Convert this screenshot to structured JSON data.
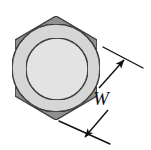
{
  "figure": {
    "background_color": "#ffffff",
    "width": 151,
    "height": 150
  },
  "shapes": {
    "hexagon": {
      "name": "hex-nut-body",
      "description": "Regular hexagon with vertices at top and bottom",
      "fill_color": "#8c8c8c",
      "stroke_color": "#1a1a1a",
      "stroke_width": 1.4,
      "center_x": 56,
      "center_y": 68,
      "circumradius": 52,
      "points": "56,16 97,40 97,96 56,120 15,96 15,40"
    },
    "chamfer_circle": {
      "name": "chamfer-circle",
      "description": "Inscribed circle representing the chamfered face",
      "fill_color": "#d8d8d8",
      "stroke_color": "#1a1a1a",
      "stroke_width": 1.4,
      "center_x": 56,
      "center_y": 68,
      "radius": 44
    },
    "inner_circle": {
      "name": "inner-circle",
      "description": "Inner circular face of the nut",
      "fill_color": "#e6e6e6",
      "stroke_color": "#1a1a1a",
      "stroke_width": 1.4,
      "center_x": 57,
      "center_y": 69,
      "radius": 31
    }
  },
  "dimension": {
    "label": "W",
    "label_meaning": "width across flats",
    "label_x": 101,
    "label_y": 105,
    "line_color": "#111111",
    "line_width": 1.4,
    "extension_line_upper": {
      "x1": 103,
      "y1": 47,
      "x2": 143,
      "y2": 68
    },
    "extension_line_lower": {
      "x1": 59,
      "y1": 121,
      "x2": 110,
      "y2": 144
    },
    "arrow_upper": {
      "from_x": 99,
      "from_y": 88,
      "to_x": 124,
      "to_y": 60
    },
    "arrow_lower": {
      "from_x": 108,
      "from_y": 110,
      "to_x": 85,
      "to_y": 137
    },
    "arrowhead_color": "#111111"
  }
}
